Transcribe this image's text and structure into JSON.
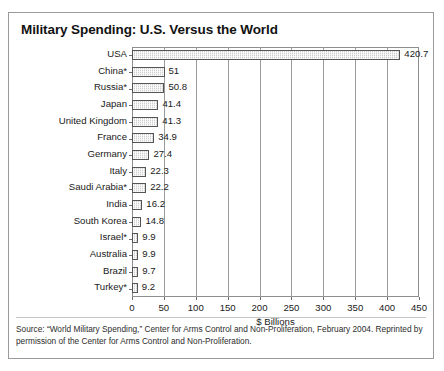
{
  "figure": {
    "title": "Military Spending: U.S. Versus the World",
    "source": "Source: “World Military Spending,” Center for Arms Control and Non-Proliferation, February 2004. Reprinted by permission of the Center for Arms Control and Non-Proliferation."
  },
  "chart_data": {
    "type": "bar",
    "orientation": "horizontal",
    "title": "Military Spending: U.S. Versus the World",
    "xlabel": "$ Billions",
    "ylabel": "",
    "xlim": [
      0,
      450
    ],
    "xticks": [
      0,
      50,
      100,
      150,
      200,
      250,
      300,
      350,
      400,
      450
    ],
    "grid": "vertical",
    "legend": "none",
    "categories": [
      "USA",
      "China*",
      "Russia*",
      "Japan",
      "United Kingdom",
      "France",
      "Germany",
      "Italy",
      "Saudi Arabia*",
      "India",
      "South Korea",
      "Israel*",
      "Australia",
      "Brazil",
      "Turkey*"
    ],
    "values": [
      420.7,
      51,
      50.8,
      41.4,
      41.3,
      34.9,
      27.4,
      22.3,
      22.2,
      16.2,
      14.8,
      9.9,
      9.9,
      9.7,
      9.2
    ],
    "value_labels": [
      "420.7",
      "51",
      "50.8",
      "41.4",
      "41.3",
      "34.9",
      "27.4",
      "22.3",
      "22.2",
      "16.2",
      "14.8",
      "9.9",
      "9.9",
      "9.7",
      "9.2"
    ],
    "bar_color": "#cfcfcf",
    "bar_edge_color": "#555555"
  }
}
